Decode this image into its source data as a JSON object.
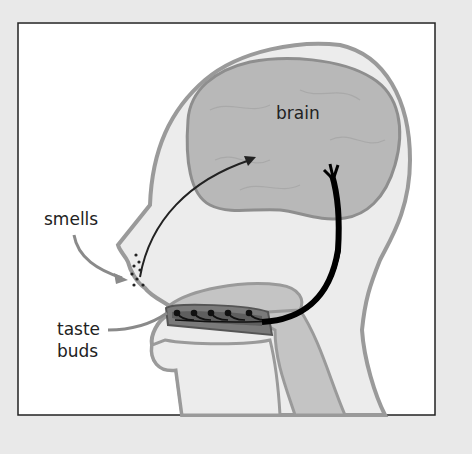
{
  "diagram": {
    "type": "anatomy-cross-section",
    "labels": {
      "brain": "brain",
      "smells": "smells",
      "taste_buds_line1": "taste",
      "taste_buds_line2": "buds"
    },
    "colors": {
      "background": "#e9e9e9",
      "panel": "#ffffff",
      "border": "#222222",
      "head_fill": "#ececec",
      "head_outline": "#9a9a9a",
      "brain_fill": "#b8b8b8",
      "brain_outline": "#8e8e8e",
      "throat_fill": "#c4c4c4",
      "tongue_fill": "#7a7a7a",
      "nerve": "#000000",
      "arrow_gray": "#8a8a8a"
    }
  }
}
